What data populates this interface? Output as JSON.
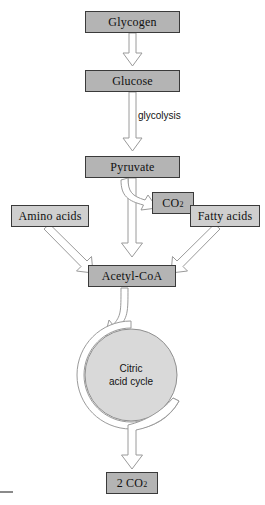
{
  "diagram": {
    "colors": {
      "node_fill": "#b4b4b4",
      "side_node_fill": "#cfcfcf",
      "node_border": "#3a3a3a",
      "arrow_fill": "#ffffff",
      "arrow_stroke": "#9a9a9a",
      "cycle_fill": "#d9d9d9"
    },
    "nodes": {
      "glycogen": "Glycogen",
      "glucose": "Glucose",
      "pyruvate": "Pyruvate",
      "co2": "CO",
      "co2_sub": "2",
      "amino_acids": "Amino acids",
      "fatty_acids": "Fatty acids",
      "acetyl_coa": "Acetyl-CoA",
      "two_co2": "2 CO",
      "two_co2_sub": "2"
    },
    "labels": {
      "glycolysis": "glycolysis",
      "cycle_line1": "Citric",
      "cycle_line2": "acid cycle"
    }
  }
}
